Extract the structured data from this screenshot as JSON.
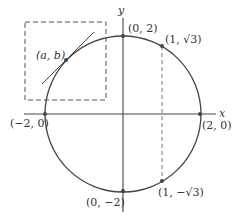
{
  "diagram": {
    "axes": {
      "x_label": "x",
      "y_label": "y"
    },
    "circle": {
      "center": [
        0,
        0
      ],
      "radius": 2
    },
    "points": [
      {
        "id": "top",
        "label": "(0, 2)"
      },
      {
        "id": "sqrt3",
        "label": "(1, √3)"
      },
      {
        "id": "left",
        "label": "(−2, 0)"
      },
      {
        "id": "right",
        "label": "(2, 0)"
      },
      {
        "id": "bottom",
        "label": "(0, −2)"
      },
      {
        "id": "negsqrt3",
        "label": "(1, −√3)"
      },
      {
        "id": "ab",
        "label": "(a, b)"
      }
    ],
    "colors": {
      "stroke": "#444444",
      "dashed": "#777777",
      "point": "#444444"
    }
  }
}
